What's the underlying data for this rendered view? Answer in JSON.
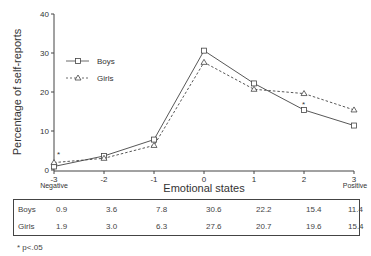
{
  "chart_data": {
    "type": "line",
    "title": "",
    "xlabel": "Emotional states",
    "ylabel": "Percentage of self-reports",
    "x": [
      -3,
      -2,
      -1,
      0,
      1,
      2,
      3
    ],
    "x_tick_labels": [
      "-3",
      "-2",
      "-1",
      "0",
      "1",
      "2",
      "3"
    ],
    "x_end_labels": {
      "left": "Negative",
      "right": "Positive"
    },
    "y_ticks": [
      0,
      10,
      20,
      30,
      40
    ],
    "ylim": [
      0,
      40
    ],
    "grid": false,
    "legend_position": "upper-left",
    "series": [
      {
        "name": "Boys",
        "marker": "square",
        "line": "solid",
        "values": [
          0.9,
          3.6,
          7.8,
          30.6,
          22.2,
          15.4,
          11.4
        ]
      },
      {
        "name": "Girls",
        "marker": "triangle",
        "line": "dashed",
        "values": [
          1.9,
          3.0,
          6.3,
          27.6,
          20.7,
          19.6,
          15.4
        ]
      }
    ],
    "annotations": [
      {
        "text": "*",
        "x": -3,
        "note": "significant difference"
      },
      {
        "text": "*",
        "x": 2,
        "note": "significant difference"
      }
    ]
  },
  "table": {
    "rows": [
      {
        "label": "Boys",
        "values": [
          "0.9",
          "3.6",
          "7.8",
          "30.6",
          "22.2",
          "15.4",
          "11.4"
        ]
      },
      {
        "label": "Girls",
        "values": [
          "1.9",
          "3.0",
          "6.3",
          "27.6",
          "20.7",
          "19.6",
          "15.4"
        ]
      }
    ]
  },
  "footnote": "* p<.05"
}
